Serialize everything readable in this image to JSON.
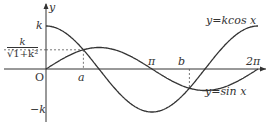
{
  "chart_data": {
    "type": "line",
    "title": "",
    "xlabel": "x",
    "ylabel": "y",
    "series": [
      {
        "name": "y=kcos x",
        "function": "k*cos(x)",
        "domain": [
          0,
          "2π"
        ]
      },
      {
        "name": "y=sin x",
        "function": "sin(x)",
        "domain": [
          0,
          "2π"
        ]
      }
    ],
    "k_approx": 2,
    "x_ticks": [
      "O",
      "a",
      "π",
      "b",
      "2π"
    ],
    "y_ticks": [
      "k",
      "k/√(1+k²)",
      "-k"
    ],
    "annotations": [
      {
        "label": "a",
        "desc": "first intersection, x where tan x = k"
      },
      {
        "label": "b",
        "desc": "second intersection, a+π"
      },
      {
        "label": "k/√(1+k²)",
        "desc": "y-value at intersection a"
      }
    ]
  },
  "labels": {
    "y_axis": "y",
    "x_axis": "x",
    "origin": "O",
    "k": "k",
    "neg_k": "−k",
    "frac_num": "k",
    "frac_den": "√1+k²",
    "a": "a",
    "pi": "π",
    "b": "b",
    "two_pi": "2π",
    "kcos": "y=kcos x",
    "sin": "y=sin x"
  },
  "colors": {
    "curve": "#333333",
    "dash": "#555555"
  }
}
